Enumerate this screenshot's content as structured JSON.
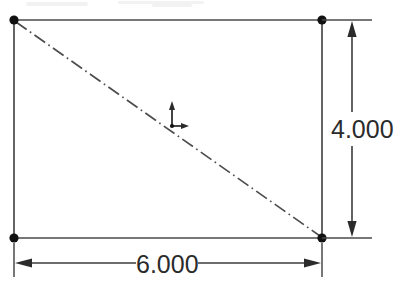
{
  "drawing": {
    "title": "Rectangle sketch with dimensions",
    "background_color": "#ffffff",
    "line_color": "#4a4a4a",
    "text_color": "#2b2b2b",
    "node_color": "#111111"
  },
  "dimensions": {
    "width": {
      "label": "6.000",
      "name": "horizontal-dimension",
      "orientation": "horizontal",
      "value": 6.0
    },
    "height": {
      "label": "4.000",
      "name": "vertical-dimension",
      "orientation": "vertical",
      "value": 4.0
    }
  },
  "geometry": {
    "shape": "rectangle",
    "corners": [
      {
        "name": "top-left",
        "x": 14,
        "y": 20
      },
      {
        "name": "top-right",
        "x": 322,
        "y": 20
      },
      {
        "name": "bottom-right",
        "x": 322,
        "y": 238
      },
      {
        "name": "bottom-left",
        "x": 14,
        "y": 238
      }
    ],
    "centerline": {
      "name": "diagonal-centerline",
      "style": "dash-dot",
      "from": "top-left",
      "to": "bottom-right"
    },
    "origin_marker": {
      "name": "origin-axes-marker",
      "x": 172,
      "y": 126
    }
  },
  "icons": {
    "arrow_up": "arrow-up-icon",
    "arrow_down": "arrow-down-icon",
    "arrow_left": "arrow-left-icon",
    "arrow_right": "arrow-right-icon",
    "origin": "origin-axes-icon",
    "node": "sketch-point-icon"
  }
}
